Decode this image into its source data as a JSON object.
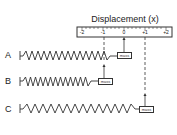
{
  "diagram": {
    "title": "Displacement (x)",
    "ruler": {
      "ticks": [
        "-2",
        "-1",
        "0",
        "+1",
        "+2"
      ]
    },
    "springs": [
      {
        "label": "A",
        "mass_label": "mass",
        "state": "equilibrium",
        "displacement": "0"
      },
      {
        "label": "B",
        "mass_label": "mass",
        "state": "compressed",
        "displacement": "-1"
      },
      {
        "label": "C",
        "mass_label": "mass",
        "state": "stretched",
        "displacement": "+1"
      }
    ]
  }
}
